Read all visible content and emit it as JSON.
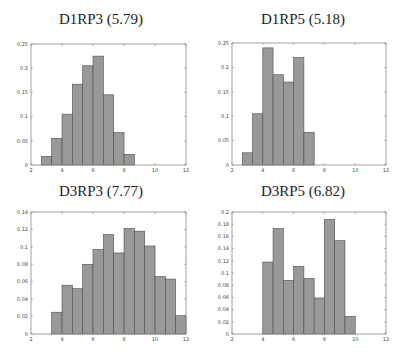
{
  "chart_data": [
    {
      "type": "bar",
      "title": "D1RP3 (5.79)",
      "xlabel": "",
      "ylabel": "",
      "xlim": [
        2,
        12
      ],
      "ylim": [
        0,
        0.25
      ],
      "xticks": [
        2,
        4,
        6,
        8,
        10,
        12
      ],
      "yticks": [
        0,
        0.05,
        0.1,
        0.15,
        0.2,
        0.25
      ],
      "ytick_labels": [
        "0",
        "0.05",
        "0.1",
        "0.15",
        "0.2",
        "0.25"
      ],
      "bin_start": 2.667,
      "bin_width": 0.667,
      "values": [
        0.018,
        0.055,
        0.105,
        0.167,
        0.205,
        0.225,
        0.145,
        0.067,
        0.022
      ],
      "grid": false
    },
    {
      "type": "bar",
      "title": "D1RP5 (5.18)",
      "xlabel": "",
      "ylabel": "",
      "xlim": [
        2,
        12
      ],
      "ylim": [
        0,
        0.25
      ],
      "xticks": [
        2,
        4,
        6,
        8,
        10,
        12
      ],
      "yticks": [
        0,
        0.05,
        0.1,
        0.15,
        0.2,
        0.25
      ],
      "ytick_labels": [
        "0",
        "0.05",
        "0.1",
        "0.15",
        "0.2",
        "0.25"
      ],
      "bin_start": 2.667,
      "bin_width": 0.667,
      "values": [
        0.025,
        0.105,
        0.24,
        0.185,
        0.17,
        0.22,
        0.067
      ],
      "grid": false
    },
    {
      "type": "bar",
      "title": "D3RP3 (7.77)",
      "xlabel": "",
      "ylabel": "",
      "xlim": [
        2,
        12
      ],
      "ylim": [
        0,
        0.14
      ],
      "xticks": [
        2,
        4,
        6,
        8,
        10,
        12
      ],
      "yticks": [
        0,
        0.02,
        0.04,
        0.06,
        0.08,
        0.1,
        0.12,
        0.14
      ],
      "ytick_labels": [
        "0",
        "0.02",
        "0.04",
        "0.06",
        "0.08",
        "0.1",
        "0.12",
        "0.14"
      ],
      "bin_start": 3.333,
      "bin_width": 0.667,
      "values": [
        0.025,
        0.056,
        0.052,
        0.08,
        0.097,
        0.114,
        0.093,
        0.121,
        0.118,
        0.101,
        0.066,
        0.063,
        0.021
      ],
      "grid": false
    },
    {
      "type": "bar",
      "title": "D3RP5 (6.82)",
      "xlabel": "",
      "ylabel": "",
      "xlim": [
        2,
        12
      ],
      "ylim": [
        0,
        0.2
      ],
      "xticks": [
        2,
        4,
        6,
        8,
        10,
        12
      ],
      "yticks": [
        0,
        0.02,
        0.04,
        0.06,
        0.08,
        0.1,
        0.12,
        0.14,
        0.16,
        0.18,
        0.2
      ],
      "ytick_labels": [
        "0",
        "0.02",
        "0.04",
        "0.06",
        "0.08",
        "0.1",
        "0.12",
        "0.14",
        "0.16",
        "0.18",
        "0.2"
      ],
      "bin_start": 4.0,
      "bin_width": 0.667,
      "values": [
        0.118,
        0.173,
        0.088,
        0.111,
        0.091,
        0.059,
        0.188,
        0.153,
        0.029
      ],
      "grid": false
    }
  ],
  "colors": {
    "bar_fill": "#999999",
    "bar_edge": "#4d4d4d",
    "axis": "#888888"
  }
}
